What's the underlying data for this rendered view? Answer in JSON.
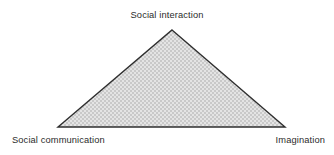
{
  "diagram": {
    "type": "triangle-diagram",
    "shape_name": "triad-triangle",
    "background_color": "#ffffff",
    "fill_base_color": "#e4e4e4",
    "fill_dot_color": "#c9c9c9",
    "fill_pattern": "checkered-stipple",
    "stroke_color": "#2f2f2f",
    "stroke_width": 1.4,
    "vertices": {
      "apex": {
        "x": 172,
        "y": 30
      },
      "bottom_left": {
        "x": 58,
        "y": 127
      },
      "bottom_right": {
        "x": 285,
        "y": 127
      }
    },
    "labels": {
      "top": "Social interaction",
      "bottom_left": "Social communication",
      "bottom_right": "Imagination"
    },
    "label_color": "#2b2b2b"
  }
}
